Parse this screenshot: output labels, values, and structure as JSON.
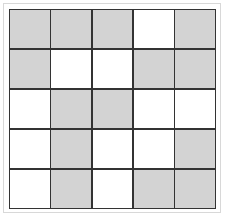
{
  "grid": {
    "rows": 5,
    "cols": 5,
    "filled_color": "#d3d3d3",
    "empty_color": "#ffffff",
    "line_color": "#333333",
    "cells": [
      [
        1,
        1,
        1,
        0,
        1
      ],
      [
        1,
        0,
        0,
        1,
        1
      ],
      [
        0,
        1,
        1,
        0,
        0
      ],
      [
        0,
        1,
        0,
        0,
        1
      ],
      [
        0,
        1,
        0,
        1,
        1
      ]
    ]
  }
}
